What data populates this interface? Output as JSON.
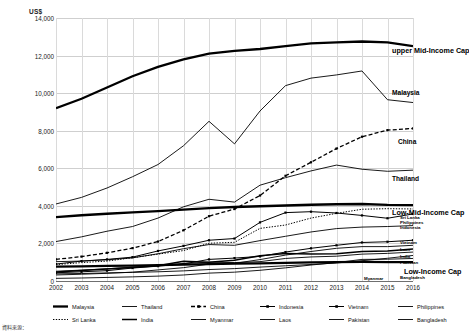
{
  "axis_unit": "US$",
  "footnote": "資料來源：",
  "callouts": [
    {
      "name": "upper Mid-Income Cap",
      "size": "big",
      "x": 392,
      "y": 47
    },
    {
      "name": "Malaysia",
      "size": "mid",
      "x": 392,
      "y": 90
    },
    {
      "name": "China",
      "size": "mid",
      "x": 398,
      "y": 139
    },
    {
      "name": "Thailand",
      "size": "mid",
      "x": 392,
      "y": 176
    },
    {
      "name": "Low-Mid-Income Cap",
      "size": "big",
      "x": 392,
      "y": 209
    },
    {
      "name": "Sri Lanka",
      "size": "small",
      "x": 400,
      "y": 216
    },
    {
      "name": "Philippines",
      "size": "small",
      "x": 400,
      "y": 221
    },
    {
      "name": "Indonesia",
      "size": "small",
      "x": 400,
      "y": 226
    },
    {
      "name": "Vietnam",
      "size": "small",
      "x": 400,
      "y": 241
    },
    {
      "name": "Laos",
      "size": "small",
      "x": 400,
      "y": 248
    },
    {
      "name": "India",
      "size": "small",
      "x": 400,
      "y": 255
    },
    {
      "name": "Pakistan",
      "size": "small",
      "x": 400,
      "y": 261
    },
    {
      "name": "Low-Income Cap",
      "size": "big",
      "x": 404,
      "y": 268
    },
    {
      "name": "Myanmar",
      "size": "small",
      "x": 364,
      "y": 277
    },
    {
      "name": "Bangladesh",
      "size": "small",
      "x": 400,
      "y": 276
    }
  ],
  "legend": [
    {
      "label": "Malaysia",
      "style": "thick"
    },
    {
      "label": "Thailand",
      "style": "thin"
    },
    {
      "label": "China",
      "style": "dashed-marker"
    },
    {
      "label": "Indonesia",
      "style": "marker"
    },
    {
      "label": "Vietnam",
      "style": "marker"
    },
    {
      "label": "Philippines",
      "style": "thin"
    },
    {
      "label": "Sri Lanka",
      "style": "dotted"
    },
    {
      "label": "India",
      "style": "thick-short"
    },
    {
      "label": "Myanmar",
      "style": "thin"
    },
    {
      "label": "Laos",
      "style": "thin"
    },
    {
      "label": "Pakistan",
      "style": "thin"
    },
    {
      "label": "Bangladesh",
      "style": "thin"
    }
  ],
  "chart_data": {
    "type": "line",
    "title": "",
    "xlabel": "",
    "ylabel": "US$",
    "ylim": [
      0,
      14000
    ],
    "yticks": [
      0,
      2000,
      4000,
      6000,
      8000,
      10000,
      12000,
      14000
    ],
    "ytick_labels": [
      "0",
      "2,000",
      "4,000",
      "6,000",
      "8,000",
      "10,000",
      "12,000",
      "14,000"
    ],
    "grid": true,
    "legend_position": "bottom",
    "x": [
      2002,
      2003,
      2004,
      2005,
      2006,
      2007,
      2008,
      2009,
      2010,
      2011,
      2012,
      2013,
      2014,
      2015,
      2016
    ],
    "xtick_labels": [
      "2002",
      "2003",
      "2004",
      "2005",
      "2006",
      "2007",
      "2008",
      "2009",
      "2010",
      "2011",
      "2012",
      "2013",
      "2014",
      "2015",
      "2016"
    ],
    "series": [
      {
        "name": "upper Mid-Income Cap",
        "style": "thick",
        "values": [
          9200,
          9700,
          10300,
          10900,
          11400,
          11800,
          12100,
          12250,
          12350,
          12500,
          12650,
          12700,
          12750,
          12700,
          12500
        ]
      },
      {
        "name": "Malaysia",
        "style": "thin",
        "values": [
          4100,
          4450,
          4950,
          5550,
          6200,
          7200,
          8500,
          7300,
          9050,
          10400,
          10800,
          10970,
          11180,
          9650,
          9500
        ]
      },
      {
        "name": "China",
        "style": "dashed-marker",
        "values": [
          1150,
          1300,
          1500,
          1750,
          2100,
          2700,
          3450,
          3830,
          4550,
          5600,
          6320,
          7050,
          7680,
          8030,
          8120
        ]
      },
      {
        "name": "Thailand",
        "style": "thin",
        "values": [
          2100,
          2350,
          2650,
          2900,
          3350,
          3950,
          4350,
          4200,
          5100,
          5500,
          5860,
          6170,
          5950,
          5840,
          5900
        ]
      },
      {
        "name": "Low-Mid-Income Cap",
        "style": "thick",
        "values": [
          3400,
          3500,
          3580,
          3650,
          3720,
          3800,
          3880,
          3940,
          3980,
          4020,
          4060,
          4085,
          4100,
          4050,
          4035
        ]
      },
      {
        "name": "Sri Lanka",
        "style": "dotted",
        "values": [
          870,
          980,
          1060,
          1240,
          1430,
          1620,
          2010,
          2060,
          2800,
          2980,
          3350,
          3600,
          3820,
          3850,
          3835
        ]
      },
      {
        "name": "Philippines",
        "style": "thin",
        "values": [
          1030,
          1060,
          1130,
          1230,
          1450,
          1720,
          1940,
          1900,
          2150,
          2380,
          2610,
          2790,
          2870,
          2900,
          2950
        ]
      },
      {
        "name": "Indonesia",
        "style": "marker",
        "values": [
          900,
          1060,
          1150,
          1270,
          1600,
          1870,
          2170,
          2260,
          3120,
          3640,
          3690,
          3620,
          3490,
          3340,
          3570
        ]
      },
      {
        "name": "Vietnam",
        "style": "marker",
        "values": [
          440,
          490,
          550,
          690,
          790,
          910,
          1150,
          1220,
          1310,
          1540,
          1740,
          1900,
          2050,
          2090,
          2170
        ]
      },
      {
        "name": "Laos",
        "style": "thin",
        "values": [
          320,
          360,
          410,
          470,
          590,
          710,
          900,
          940,
          1140,
          1380,
          1570,
          1740,
          1830,
          1830,
          1900
        ]
      },
      {
        "name": "India",
        "style": "thick-short",
        "values": [
          480,
          560,
          640,
          720,
          810,
          1050,
          1000,
          1100,
          1350,
          1460,
          1440,
          1450,
          1570,
          1600,
          1710
        ]
      },
      {
        "name": "Pakistan",
        "style": "thin",
        "values": [
          520,
          580,
          650,
          740,
          840,
          930,
          1000,
          980,
          1030,
          1200,
          1280,
          1320,
          1430,
          1470,
          1540
        ]
      },
      {
        "name": "Low-Income Cap",
        "style": "thick",
        "values": [
          760,
          780,
          800,
          820,
          840,
          870,
          900,
          920,
          940,
          960,
          990,
          1005,
          1020,
          1005,
          1005
        ]
      },
      {
        "name": "Myanmar",
        "style": "thin",
        "values": [
          140,
          160,
          190,
          220,
          260,
          320,
          420,
          470,
          570,
          700,
          850,
          980,
          1150,
          1160,
          1200
        ]
      },
      {
        "name": "Bangladesh",
        "style": "thin",
        "values": [
          380,
          400,
          430,
          460,
          490,
          540,
          610,
          660,
          740,
          810,
          880,
          960,
          1080,
          1210,
          1360
        ]
      }
    ]
  }
}
